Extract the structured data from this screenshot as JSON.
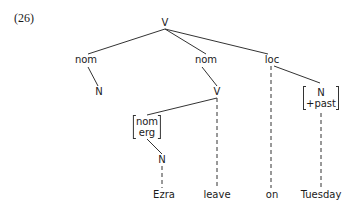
{
  "example_number": "(26)",
  "tree": {
    "root": "V",
    "nodes": {
      "root_v": "V",
      "nom_left": "nom",
      "n_left": "N",
      "nom_mid": "nom",
      "v_mid": "V",
      "loc": "loc",
      "n_past": {
        "line1": "N",
        "line2": "+past"
      },
      "nom_erg": {
        "line1": "nom",
        "line2": "erg"
      },
      "n_ezra": "N"
    },
    "leaves": {
      "ezra": "Ezra",
      "leave": "leave",
      "on": "on",
      "tuesday": "Tuesday"
    }
  }
}
